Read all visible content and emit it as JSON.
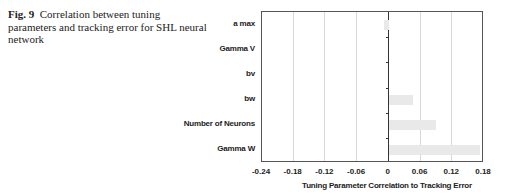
{
  "caption": {
    "fig_label": "Fig. 9",
    "text": "Correlation between tuning parameters and tracking error for SHL neural network"
  },
  "chart_data": {
    "type": "bar",
    "orientation": "horizontal",
    "title": "",
    "categories": [
      "a max",
      "Gamma V",
      "bv",
      "bw",
      "Number of Neurons",
      "Gamma W"
    ],
    "values": [
      -0.01,
      0.0,
      0.0,
      0.045,
      0.089,
      0.172
    ],
    "xlabel": "Tuning Parameter Correlation to Tracking Error",
    "ylabel": "",
    "xlim": [
      -0.24,
      0.18
    ],
    "xticks": [
      "-0.24",
      "-0.18",
      "-0.12",
      "-0.06",
      "0",
      "0.06",
      "0.12",
      "0.18"
    ],
    "grid": "vertical",
    "bar_color": "#e9e9e9"
  }
}
